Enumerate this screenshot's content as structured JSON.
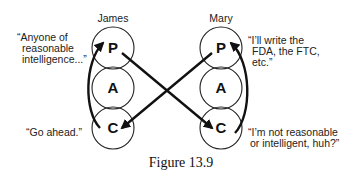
{
  "figure": {
    "caption": "Figure 13.9",
    "people": [
      {
        "name": "James",
        "states": [
          "P",
          "A",
          "C"
        ]
      },
      {
        "name": "Mary",
        "states": [
          "P",
          "A",
          "C"
        ]
      }
    ],
    "quotes": {
      "james_p": [
        "“Anyone of",
        "reasonable",
        "intelligence...”"
      ],
      "james_c": [
        "“Go ahead.”"
      ],
      "mary_p": [
        "“I’ll write the",
        "FDA, the FTC,",
        "etc.”"
      ],
      "mary_c": [
        "“I’m not reasonable",
        "or intelligent, huh?”"
      ]
    },
    "transactions": [
      {
        "from": "James.C",
        "to": "James.P",
        "type": "internal curved arrow"
      },
      {
        "from": "James.P",
        "to": "Mary.C",
        "type": "crossed arrow"
      },
      {
        "from": "Mary.P",
        "to": "James.C",
        "type": "crossed arrow"
      },
      {
        "from": "Mary.C",
        "to": "Mary.P",
        "type": "internal curved arrow"
      }
    ]
  }
}
